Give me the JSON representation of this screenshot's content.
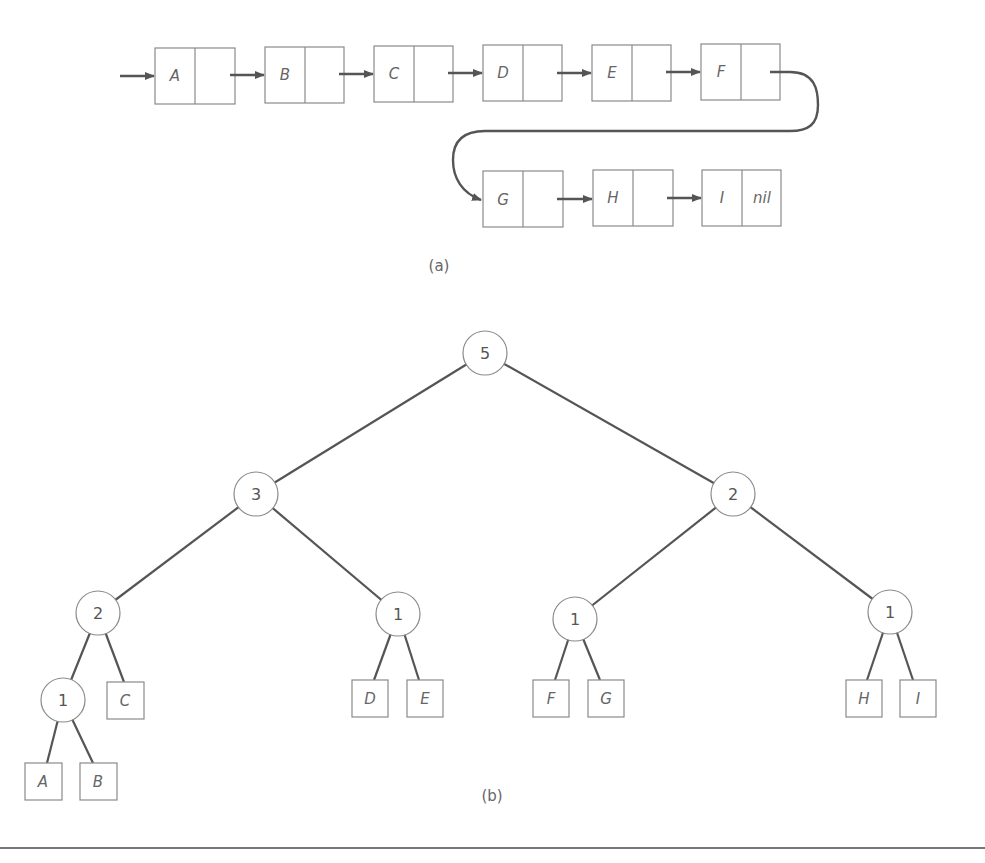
{
  "figure_a": {
    "caption": "(a)",
    "list_nodes": [
      {
        "label": "A",
        "next": ""
      },
      {
        "label": "B",
        "next": ""
      },
      {
        "label": "C",
        "next": ""
      },
      {
        "label": "D",
        "next": ""
      },
      {
        "label": "E",
        "next": ""
      },
      {
        "label": "F",
        "next": ""
      },
      {
        "label": "G",
        "next": ""
      },
      {
        "label": "H",
        "next": ""
      },
      {
        "label": "I",
        "next": "nil"
      }
    ]
  },
  "figure_b": {
    "caption": "(b)",
    "internal_nodes": [
      {
        "id": "root",
        "value": "5"
      },
      {
        "id": "l",
        "value": "3"
      },
      {
        "id": "r",
        "value": "2"
      },
      {
        "id": "ll",
        "value": "2"
      },
      {
        "id": "lr",
        "value": "1"
      },
      {
        "id": "rl",
        "value": "1"
      },
      {
        "id": "rr",
        "value": "1"
      },
      {
        "id": "lll",
        "value": "1"
      }
    ],
    "leaves": [
      {
        "parent": "lll",
        "label": "A"
      },
      {
        "parent": "lll",
        "label": "B"
      },
      {
        "parent": "ll",
        "label": "C"
      },
      {
        "parent": "lr",
        "label": "D"
      },
      {
        "parent": "lr",
        "label": "E"
      },
      {
        "parent": "rl",
        "label": "F"
      },
      {
        "parent": "rl",
        "label": "G"
      },
      {
        "parent": "rr",
        "label": "H"
      },
      {
        "parent": "rr",
        "label": "I"
      }
    ]
  }
}
